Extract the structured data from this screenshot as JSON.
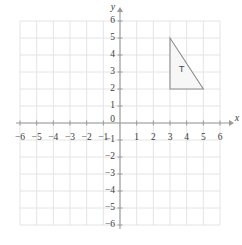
{
  "figure": {
    "title": "",
    "background_color": "#ffffff"
  },
  "chart_data": {
    "type": "scatter",
    "title": "",
    "xlabel": "x",
    "ylabel": "y",
    "xlim": [
      -6,
      6
    ],
    "ylim": [
      -6,
      6
    ],
    "grid": true,
    "legend": null,
    "x_tick_labels": [
      "−6",
      "−5",
      "−4",
      "−3",
      "−2",
      "−1",
      "0",
      "1",
      "2",
      "3",
      "4",
      "5",
      "6"
    ],
    "x_tick_values": [
      -6,
      -5,
      -4,
      -3,
      -2,
      -1,
      0,
      1,
      2,
      3,
      4,
      5,
      6
    ],
    "y_tick_labels": [
      "6",
      "5",
      "4",
      "3",
      "2",
      "1",
      "−1",
      "−2",
      "−3",
      "−4",
      "−5",
      "−6"
    ],
    "y_tick_values": [
      6,
      5,
      4,
      3,
      2,
      1,
      -1,
      -2,
      -3,
      -4,
      -5,
      -6
    ],
    "origin_label": "0",
    "shapes": [
      {
        "name": "triangle-T",
        "label": "T",
        "label_position": [
          3.7,
          3.15
        ],
        "vertices": [
          [
            3,
            5
          ],
          [
            3,
            2
          ],
          [
            5,
            2
          ]
        ],
        "fill": "#f7f7f7",
        "stroke": "#8c8c8c"
      }
    ],
    "colors": {
      "grid_line": "#e4e4e6",
      "axis_line": "#9a9a9a",
      "tick_text": "#3c3c3c",
      "shape_fill": "#f7f7f7",
      "shape_stroke": "#8c8c8c"
    }
  }
}
